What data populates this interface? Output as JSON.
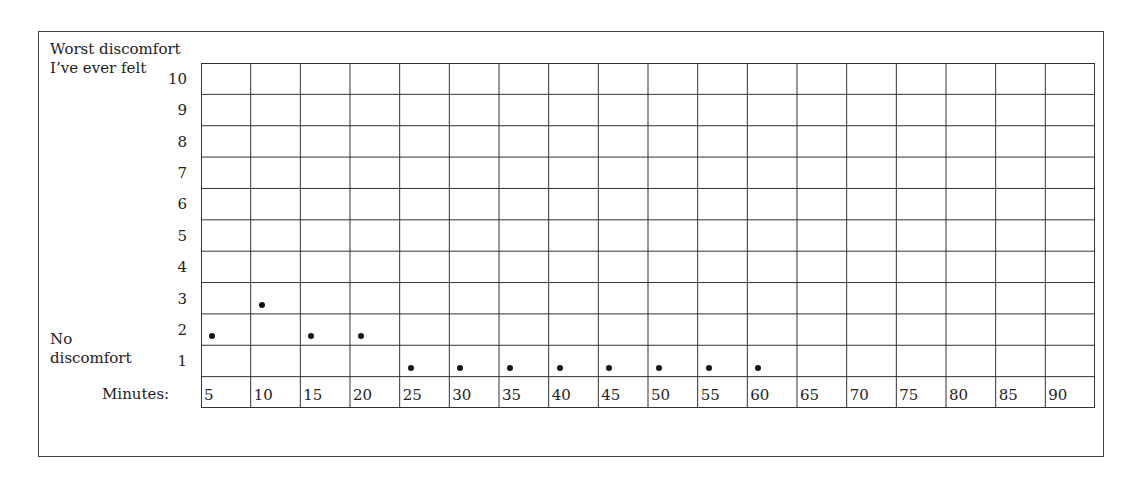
{
  "chart": {
    "top_label_line1": "Worst discomfort",
    "top_label_line2": "I’ve ever felt",
    "bottom_label_line1": "No",
    "bottom_label_line2": "discomfort",
    "x_label": "Minutes:"
  },
  "chart_data": {
    "type": "scatter",
    "title": "",
    "xlabel": "Minutes",
    "ylabel": "Discomfort rating (1 = No discomfort, 10 = Worst discomfort I've ever felt)",
    "y_top_label": "Worst discomfort I've ever felt",
    "y_bottom_label": "No discomfort",
    "x_ticks": [
      5,
      10,
      15,
      20,
      25,
      30,
      35,
      40,
      45,
      50,
      55,
      60,
      65,
      70,
      75,
      80,
      85,
      90
    ],
    "y_ticks": [
      10,
      9,
      8,
      7,
      6,
      5,
      4,
      3,
      2,
      1
    ],
    "ylim": [
      1,
      10
    ],
    "xlim": [
      5,
      90
    ],
    "grid": true,
    "legend": null,
    "points": [
      {
        "x": 5,
        "y": 2
      },
      {
        "x": 10,
        "y": 3
      },
      {
        "x": 15,
        "y": 2
      },
      {
        "x": 20,
        "y": 2
      },
      {
        "x": 25,
        "y": 1
      },
      {
        "x": 30,
        "y": 1
      },
      {
        "x": 35,
        "y": 1
      },
      {
        "x": 40,
        "y": 1
      },
      {
        "x": 45,
        "y": 1
      },
      {
        "x": 50,
        "y": 1
      },
      {
        "x": 55,
        "y": 1
      },
      {
        "x": 60,
        "y": 1
      }
    ]
  }
}
